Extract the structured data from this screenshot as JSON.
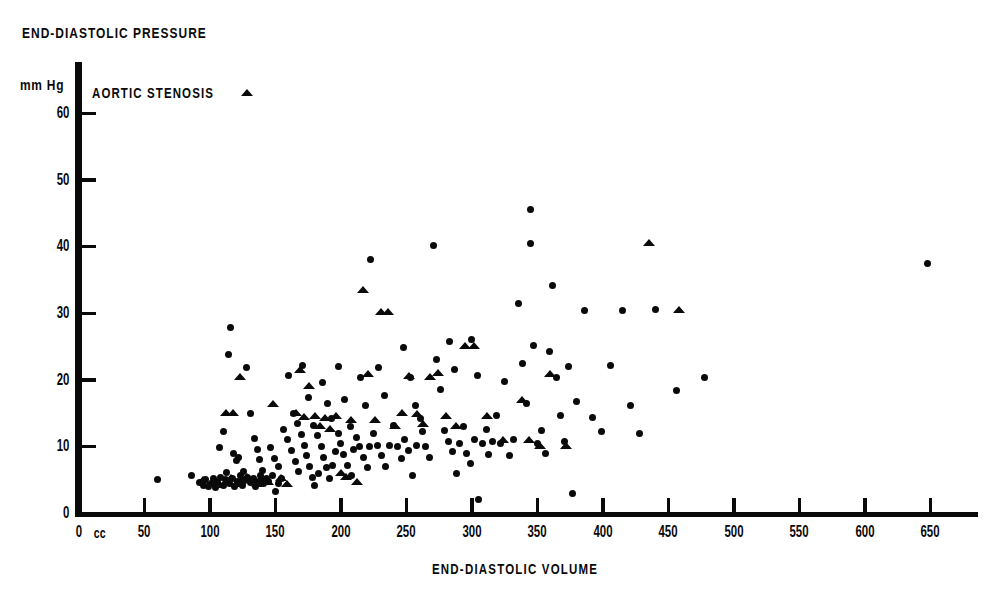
{
  "figure": {
    "y_axis_title": "END-DIASTOLIC PRESSURE",
    "x_axis_title": "END-DIASTOLIC VOLUME",
    "y_units_label": "mm Hg",
    "x_units_label": "cc",
    "legend_label": "AORTIC STENOSIS",
    "legend_marker": "triangle-up-icon",
    "ink_color": "#0a0a0a",
    "background_color": "#ffffff"
  },
  "chart_data": {
    "type": "scatter",
    "title": "",
    "xlabel": "END-DIASTOLIC VOLUME",
    "ylabel": "END-DIASTOLIC PRESSURE",
    "x_unit": "cc",
    "y_unit": "mm Hg",
    "xlim": [
      0,
      680
    ],
    "ylim": [
      0,
      64
    ],
    "xticks": [
      0,
      50,
      100,
      150,
      200,
      250,
      300,
      350,
      400,
      450,
      500,
      550,
      600,
      650
    ],
    "yticks": [
      0,
      10,
      20,
      30,
      40,
      50,
      60
    ],
    "grid": false,
    "legend_position": "top-left",
    "series": [
      {
        "name": "Other",
        "marker": "circle",
        "points": [
          [
            60,
            5.0
          ],
          [
            86,
            5.6
          ],
          [
            92,
            4.6
          ],
          [
            95,
            4.2
          ],
          [
            97,
            5.0
          ],
          [
            99,
            4.0
          ],
          [
            101,
            4.4
          ],
          [
            103,
            5.2
          ],
          [
            104,
            3.8
          ],
          [
            106,
            4.6
          ],
          [
            108,
            5.4
          ],
          [
            110,
            4.2
          ],
          [
            112,
            5.0
          ],
          [
            113,
            6.1
          ],
          [
            115,
            4.4
          ],
          [
            117,
            5.2
          ],
          [
            119,
            4.0
          ],
          [
            120,
            7.9
          ],
          [
            121,
            4.8
          ],
          [
            123,
            5.6
          ],
          [
            125,
            4.2
          ],
          [
            127,
            5.0
          ],
          [
            107,
            9.8
          ],
          [
            110,
            12.2
          ],
          [
            114,
            23.8
          ],
          [
            118,
            9.0
          ],
          [
            122,
            8.4
          ],
          [
            126,
            6.2
          ],
          [
            129,
            5.4
          ],
          [
            131,
            4.6
          ],
          [
            133,
            5.2
          ],
          [
            135,
            4.0
          ],
          [
            137,
            4.8
          ],
          [
            139,
            5.6
          ],
          [
            141,
            4.4
          ],
          [
            143,
            5.2
          ],
          [
            116,
            27.8
          ],
          [
            128,
            21.8
          ],
          [
            131,
            14.9
          ],
          [
            134,
            11.2
          ],
          [
            136,
            9.6
          ],
          [
            138,
            8.0
          ],
          [
            140,
            6.4
          ],
          [
            145,
            4.8
          ],
          [
            148,
            5.6
          ],
          [
            150,
            3.2
          ],
          [
            152,
            4.4
          ],
          [
            155,
            5.2
          ],
          [
            146,
            9.8
          ],
          [
            149,
            8.2
          ],
          [
            152,
            7.0
          ],
          [
            156,
            12.6
          ],
          [
            159,
            11.0
          ],
          [
            162,
            9.4
          ],
          [
            165,
            7.8
          ],
          [
            168,
            6.2
          ],
          [
            160,
            20.6
          ],
          [
            164,
            15.0
          ],
          [
            167,
            13.4
          ],
          [
            170,
            11.8
          ],
          [
            172,
            10.2
          ],
          [
            174,
            8.6
          ],
          [
            176,
            7.0
          ],
          [
            178,
            5.4
          ],
          [
            180,
            4.2
          ],
          [
            183,
            6.0
          ],
          [
            171,
            22.2
          ],
          [
            175,
            17.4
          ],
          [
            179,
            13.2
          ],
          [
            182,
            11.6
          ],
          [
            185,
            10.0
          ],
          [
            187,
            8.4
          ],
          [
            189,
            6.8
          ],
          [
            191,
            5.2
          ],
          [
            194,
            7.2
          ],
          [
            196,
            9.2
          ],
          [
            186,
            19.6
          ],
          [
            190,
            16.4
          ],
          [
            193,
            14.2
          ],
          [
            198,
            12.0
          ],
          [
            200,
            10.4
          ],
          [
            202,
            8.8
          ],
          [
            205,
            7.2
          ],
          [
            208,
            5.6
          ],
          [
            210,
            9.6
          ],
          [
            212,
            11.4
          ],
          [
            198,
            22.0
          ],
          [
            203,
            17.0
          ],
          [
            207,
            13.0
          ],
          [
            214,
            10.0
          ],
          [
            217,
            8.4
          ],
          [
            220,
            6.8
          ],
          [
            222,
            10.0
          ],
          [
            225,
            12.0
          ],
          [
            215,
            20.4
          ],
          [
            219,
            16.2
          ],
          [
            223,
            38.0
          ],
          [
            228,
            10.2
          ],
          [
            231,
            8.6
          ],
          [
            234,
            7.0
          ],
          [
            237,
            10.2
          ],
          [
            240,
            13.2
          ],
          [
            229,
            21.8
          ],
          [
            233,
            17.6
          ],
          [
            243,
            10.0
          ],
          [
            246,
            8.2
          ],
          [
            249,
            11.0
          ],
          [
            252,
            9.4
          ],
          [
            255,
            5.6
          ],
          [
            258,
            10.2
          ],
          [
            262,
            12.2
          ],
          [
            248,
            24.8
          ],
          [
            253,
            20.4
          ],
          [
            257,
            16.2
          ],
          [
            261,
            14.2
          ],
          [
            265,
            10.0
          ],
          [
            268,
            8.4
          ],
          [
            271,
            40.2
          ],
          [
            273,
            23.0
          ],
          [
            276,
            18.6
          ],
          [
            279,
            12.4
          ],
          [
            282,
            10.8
          ],
          [
            285,
            9.2
          ],
          [
            288,
            6.0
          ],
          [
            291,
            10.4
          ],
          [
            294,
            13.0
          ],
          [
            283,
            25.8
          ],
          [
            287,
            21.6
          ],
          [
            296,
            9.0
          ],
          [
            299,
            7.4
          ],
          [
            302,
            11.0
          ],
          [
            305,
            2.0
          ],
          [
            308,
            10.4
          ],
          [
            311,
            12.6
          ],
          [
            300,
            26.0
          ],
          [
            304,
            20.6
          ],
          [
            313,
            8.8
          ],
          [
            316,
            10.8
          ],
          [
            319,
            14.6
          ],
          [
            322,
            10.4
          ],
          [
            325,
            19.8
          ],
          [
            329,
            8.6
          ],
          [
            332,
            11.0
          ],
          [
            336,
            31.4
          ],
          [
            339,
            22.4
          ],
          [
            342,
            16.4
          ],
          [
            345,
            45.5
          ],
          [
            345,
            40.4
          ],
          [
            347,
            25.2
          ],
          [
            350,
            10.4
          ],
          [
            353,
            12.4
          ],
          [
            356,
            9.0
          ],
          [
            359,
            24.2
          ],
          [
            362,
            34.2
          ],
          [
            365,
            20.4
          ],
          [
            368,
            14.6
          ],
          [
            371,
            10.8
          ],
          [
            374,
            22.0
          ],
          [
            377,
            3.0
          ],
          [
            380,
            16.8
          ],
          [
            386,
            30.4
          ],
          [
            392,
            14.4
          ],
          [
            399,
            12.2
          ],
          [
            406,
            22.2
          ],
          [
            415,
            30.4
          ],
          [
            421,
            16.2
          ],
          [
            428,
            12.0
          ],
          [
            440,
            30.5
          ],
          [
            456,
            18.4
          ],
          [
            478,
            20.4
          ],
          [
            648,
            37.5
          ]
        ]
      },
      {
        "name": "AORTIC STENOSIS",
        "marker": "triangle",
        "points": [
          [
            95,
            5.0
          ],
          [
            100,
            4.4
          ],
          [
            104,
            5.0
          ],
          [
            108,
            4.2
          ],
          [
            112,
            4.6
          ],
          [
            116,
            5.2
          ],
          [
            120,
            4.4
          ],
          [
            112,
            15.0
          ],
          [
            118,
            15.0
          ],
          [
            124,
            4.8
          ],
          [
            128,
            5.4
          ],
          [
            123,
            20.4
          ],
          [
            132,
            5.0
          ],
          [
            136,
            4.4
          ],
          [
            140,
            5.0
          ],
          [
            144,
            4.6
          ],
          [
            148,
            16.4
          ],
          [
            154,
            5.2
          ],
          [
            159,
            4.4
          ],
          [
            166,
            15.0
          ],
          [
            169,
            21.4
          ],
          [
            172,
            14.4
          ],
          [
            176,
            19.0
          ],
          [
            180,
            14.6
          ],
          [
            184,
            13.0
          ],
          [
            188,
            14.2
          ],
          [
            192,
            12.6
          ],
          [
            196,
            14.6
          ],
          [
            200,
            6.0
          ],
          [
            204,
            5.4
          ],
          [
            208,
            14.0
          ],
          [
            212,
            4.6
          ],
          [
            217,
            33.4
          ],
          [
            221,
            20.8
          ],
          [
            226,
            14.0
          ],
          [
            231,
            30.2
          ],
          [
            236,
            30.2
          ],
          [
            241,
            13.0
          ],
          [
            247,
            15.0
          ],
          [
            252,
            20.6
          ],
          [
            258,
            14.8
          ],
          [
            263,
            13.4
          ],
          [
            268,
            20.4
          ],
          [
            274,
            21.0
          ],
          [
            280,
            14.6
          ],
          [
            288,
            13.0
          ],
          [
            295,
            25.0
          ],
          [
            302,
            25.0
          ],
          [
            312,
            14.6
          ],
          [
            324,
            11.0
          ],
          [
            338,
            17.0
          ],
          [
            344,
            11.0
          ],
          [
            352,
            10.0
          ],
          [
            360,
            20.8
          ],
          [
            372,
            10.0
          ],
          [
            435,
            40.5
          ],
          [
            458,
            30.5
          ]
        ]
      }
    ]
  },
  "axes": {
    "x_tick_labels": [
      "0",
      "50",
      "100",
      "150",
      "200",
      "250",
      "300",
      "350",
      "400",
      "450",
      "500",
      "550",
      "600",
      "650"
    ],
    "y_tick_labels": [
      "0",
      "10",
      "20",
      "30",
      "40",
      "50",
      "60"
    ]
  }
}
